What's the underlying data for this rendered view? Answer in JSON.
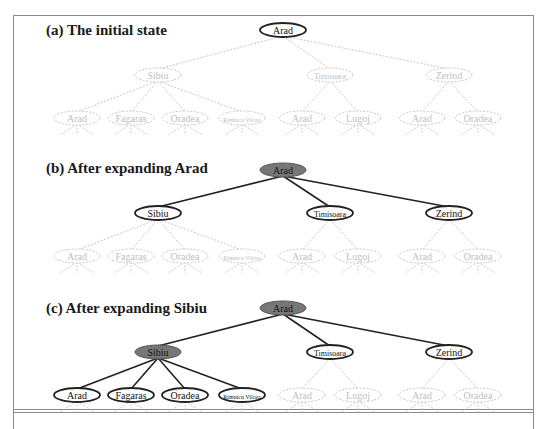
{
  "figure": {
    "panels": [
      {
        "id": "a",
        "title": "(a) The initial state",
        "title_y": 22,
        "root_y": 30,
        "level1_y": 75,
        "leaf_y": 118,
        "expanded": []
      },
      {
        "id": "b",
        "title": "(b) After expanding Arad",
        "title_y": 160,
        "root_y": 170,
        "level1_y": 213,
        "leaf_y": 256,
        "expanded": [
          "root"
        ]
      },
      {
        "id": "c",
        "title": "(c) After expanding Sibiu",
        "title_y": 300,
        "root_y": 308,
        "level1_y": 352,
        "leaf_y": 395,
        "expanded": [
          "root",
          "sibiu"
        ]
      }
    ],
    "tree": {
      "root": {
        "key": "root",
        "label": "Arad",
        "x": 283
      },
      "children": [
        {
          "key": "sibiu",
          "label": "Sibiu",
          "x": 158,
          "children": [
            {
              "label": "Arad",
              "x": 77
            },
            {
              "label": "Fagaras",
              "x": 131
            },
            {
              "label": "Oradea",
              "x": 185
            },
            {
              "label": "Rimnicu Vilcea",
              "x": 242,
              "small": true
            }
          ]
        },
        {
          "key": "timisoara",
          "label": "Timisoara",
          "x": 330,
          "smallish": true,
          "children": [
            {
              "label": "Arad",
              "x": 302
            },
            {
              "label": "Lugoj",
              "x": 358
            }
          ]
        },
        {
          "key": "zerind",
          "label": "Zerind",
          "x": 449,
          "children": [
            {
              "label": "Arad",
              "x": 422
            },
            {
              "label": "Oradea",
              "x": 478
            }
          ]
        }
      ]
    },
    "colors": {
      "expanded_fill": "#777777",
      "frontier_stroke": "#222222",
      "unexplored_stroke": "#c8c8c8",
      "unexplored_text": "#c0c0c0",
      "edge_solid": "#222222",
      "frame": "#8a8a8a"
    }
  }
}
